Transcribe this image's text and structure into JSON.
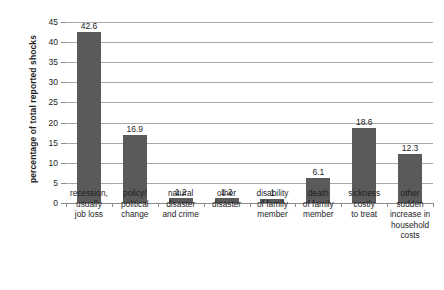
{
  "chart_data": {
    "type": "bar",
    "title": "",
    "xlabel": "",
    "ylabel": "percentage of total reported shocks",
    "ylim": [
      0,
      45
    ],
    "ytick_step": 5,
    "yticks": [
      "45",
      "40",
      "35",
      "30",
      "25",
      "20",
      "15",
      "10",
      "5",
      "0"
    ],
    "grid": true,
    "legend": "none",
    "bar_color": "#5a5a5a",
    "gridline_color": "#a9a9a9",
    "categories": [
      "recession, usually job loss",
      "policy/ political change",
      "natural disaster and crime",
      "other disaster",
      "disability of family member",
      "death of family member",
      "sickness costly to treat",
      "other sudden increase in household costs"
    ],
    "category_lines": [
      [
        "recession,",
        "usually",
        "job loss"
      ],
      [
        "policy/",
        "political",
        "change"
      ],
      [
        "natural",
        "disaster",
        "and crime"
      ],
      [
        "other",
        "disaster"
      ],
      [
        "disability",
        "of family",
        "member"
      ],
      [
        "death",
        "of family",
        "member"
      ],
      [
        "sickness",
        "costly",
        "to treat"
      ],
      [
        "other",
        "sudden",
        "increase in",
        "household",
        "costs"
      ]
    ],
    "values": [
      42.6,
      16.9,
      1.2,
      1.2,
      1,
      6.1,
      18.6,
      12.3
    ],
    "value_labels": [
      "42.6",
      "16.9",
      "1.2",
      "1.2",
      "1",
      "6.1",
      "18.6",
      "12.3"
    ]
  }
}
